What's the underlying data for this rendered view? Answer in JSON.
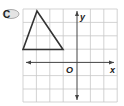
{
  "choice": {
    "label": "C"
  },
  "graph": {
    "x_axis_label": "x",
    "y_axis_label": "y",
    "origin_label": "O",
    "grid": {
      "x_min": -4,
      "x_max": 3,
      "y_min": -3,
      "y_max": 4,
      "cell_px": 13.4
    },
    "triangle": {
      "vertices": [
        [
          -3,
          4
        ],
        [
          -4,
          1
        ],
        [
          -1,
          1
        ]
      ],
      "stroke": "#333333"
    },
    "colors": {
      "grid": "#c8c8c8",
      "axis": "#444444",
      "badge_fill": "#e8e8e8"
    }
  }
}
